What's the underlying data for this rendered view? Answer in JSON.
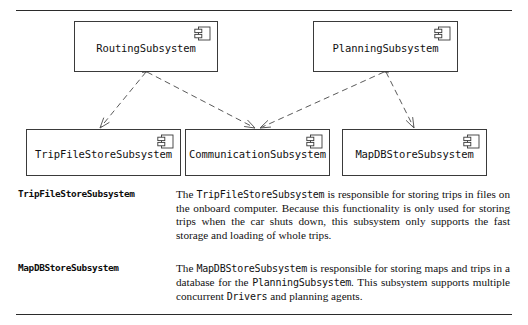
{
  "figure": {
    "type": "uml-component-diagram",
    "rules": {
      "top_label": "section-rule-top",
      "bottom_label": "section-rule-bottom"
    }
  },
  "diagram": {
    "components": [
      {
        "id": "routing",
        "name": "RoutingSubsystem",
        "icon": "uml-component-icon",
        "x": 74,
        "y": 21,
        "w": 144,
        "h": 51
      },
      {
        "id": "planning",
        "name": "PlanningSubsystem",
        "icon": "uml-component-icon",
        "x": 313,
        "y": 21,
        "w": 145,
        "h": 51
      },
      {
        "id": "tripfilestore",
        "name": "TripFileStoreSubsystem",
        "icon": "uml-component-icon",
        "x": 26,
        "y": 129,
        "w": 155,
        "h": 47
      },
      {
        "id": "communication",
        "name": "CommunicationSubsystem",
        "icon": "uml-component-icon",
        "x": 185,
        "y": 129,
        "w": 145,
        "h": 47
      },
      {
        "id": "mapdbstore",
        "name": "MapDBStoreSubsystem",
        "icon": "uml-component-icon",
        "x": 342,
        "y": 129,
        "w": 145,
        "h": 47
      }
    ],
    "dependencies": [
      {
        "id": "dep-routing-tripfilestore",
        "from": "routing",
        "to": "tripfilestore",
        "style": "dashed-open-arrow",
        "x1": 146,
        "y1": 72,
        "x2": 100,
        "y2": 128
      },
      {
        "id": "dep-routing-communication",
        "from": "routing",
        "to": "communication",
        "style": "dashed-open-arrow",
        "x1": 147,
        "y1": 72,
        "x2": 255,
        "y2": 128
      },
      {
        "id": "dep-planning-communication",
        "from": "planning",
        "to": "communication",
        "style": "dashed-open-arrow",
        "x1": 384,
        "y1": 72,
        "x2": 260,
        "y2": 128
      },
      {
        "id": "dep-planning-mapdbstore",
        "from": "planning",
        "to": "mapdbstore",
        "style": "dashed-open-arrow",
        "x1": 386,
        "y1": 72,
        "x2": 414,
        "y2": 128
      }
    ],
    "colors": {
      "stroke": "#3a3a3a",
      "edge": "#5a5a5a",
      "text": "#111111",
      "background": "#ffffff"
    }
  },
  "descriptions": [
    {
      "id": "tripfilestore",
      "term": "TripFileStoreSubsystem",
      "body_segments": [
        {
          "text": "The ",
          "mono": false
        },
        {
          "text": "TripFileStoreSubsystem",
          "mono": true
        },
        {
          "text": " is responsible for storing trips in files on the onboard computer. Because this functionality is only used for storing trips when the car shuts down, this subsystem only supports the fast storage and loading of whole trips.",
          "mono": false
        }
      ],
      "body_plain": "The TripFileStoreSubsystem is responsible for storing trips in files on the onboard computer. Because this functionality is only used for storing trips when the car shuts down, this subsystem only supports the fast storage and loading of whole trips."
    },
    {
      "id": "mapdbstore",
      "term": "MapDBStoreSubsystem",
      "body_segments": [
        {
          "text": "The ",
          "mono": false
        },
        {
          "text": "MapDBStoreSubsystem",
          "mono": true
        },
        {
          "text": " is responsible for storing maps and trips in a database for the ",
          "mono": false
        },
        {
          "text": "PlanningSubsystem",
          "mono": true
        },
        {
          "text": ". This subsystem supports multiple concurrent ",
          "mono": false
        },
        {
          "text": "Drivers",
          "mono": true
        },
        {
          "text": " and planning agents.",
          "mono": false
        }
      ],
      "body_plain": "The MapDBStoreSubsystem is responsible for storing maps and trips in a database for the PlanningSubsystem. This subsystem supports multiple concurrent Drivers and planning agents."
    }
  ]
}
